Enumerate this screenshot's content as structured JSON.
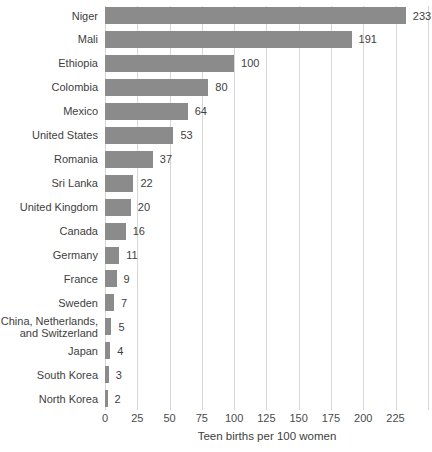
{
  "chart_data": {
    "type": "bar",
    "orientation": "horizontal",
    "categories": [
      "Niger",
      "Mali",
      "Ethiopia",
      "Colombia",
      "Mexico",
      "United States",
      "Romania",
      "Sri Lanka",
      "United Kingdom",
      "Canada",
      "Germany",
      "France",
      "Sweden",
      "China, Netherlands,\nand Switzerland",
      "Japan",
      "South Korea",
      "North Korea"
    ],
    "values": [
      233,
      191,
      100,
      80,
      64,
      53,
      37,
      22,
      20,
      16,
      11,
      9,
      7,
      5,
      4,
      3,
      2
    ],
    "title": "",
    "xlabel": "Teen births per 100 women",
    "ylabel": "",
    "xlim": [
      0,
      250
    ],
    "xticks": [
      0,
      25,
      50,
      75,
      100,
      125,
      150,
      175,
      200,
      225
    ],
    "gridlines": [
      0,
      25,
      50,
      75,
      100,
      125,
      150,
      175,
      200,
      225,
      250
    ],
    "grid": "vertical",
    "value_labels": "end-of-bar",
    "legend": "none",
    "colors": {
      "bar": "#8b8b8b",
      "gridline": "#d7d7d7",
      "category_text": "#3e3e3e",
      "value_text": "#3e3e3e",
      "tick_text": "#4a4a4a",
      "axis_title_text": "#3e3e3e",
      "background": "#ffffff"
    }
  }
}
